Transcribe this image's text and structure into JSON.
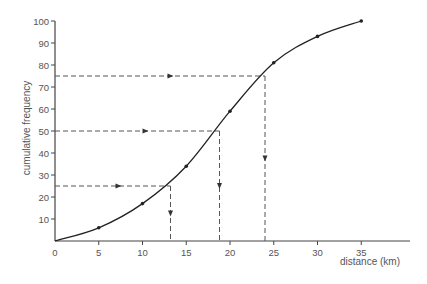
{
  "chart_data": {
    "type": "line",
    "title": "",
    "xlabel": "distance (km)",
    "ylabel": "cumulative frequency",
    "xlim": [
      0,
      40
    ],
    "ylim": [
      0,
      100
    ],
    "x_ticks": [
      0,
      5,
      10,
      15,
      20,
      25,
      30,
      35
    ],
    "y_ticks": [
      10,
      20,
      30,
      40,
      50,
      60,
      70,
      80,
      90,
      100
    ],
    "grid": false,
    "series": [
      {
        "name": "cumulative frequency curve",
        "x": [
          0,
          5,
          10,
          15,
          20,
          25,
          30,
          35
        ],
        "y": [
          0,
          6,
          17,
          34,
          59,
          81,
          93,
          100
        ]
      }
    ],
    "annotations": [
      {
        "type": "quartile-readoff",
        "label": "lower quartile",
        "y": 25,
        "x": 13.2
      },
      {
        "type": "quartile-readoff",
        "label": "median",
        "y": 50,
        "x": 18.8
      },
      {
        "type": "quartile-readoff",
        "label": "upper quartile",
        "y": 75,
        "x": 24.0
      }
    ]
  },
  "colors": {
    "curve": "#222222",
    "axis": "#444444",
    "dashed": "#555555",
    "text": "#555555"
  }
}
